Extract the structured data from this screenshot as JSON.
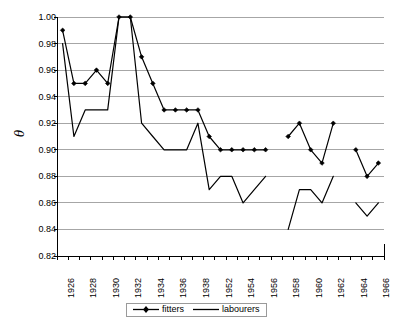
{
  "chart_data": {
    "type": "line",
    "title": "",
    "xlabel": "",
    "ylabel": "θ",
    "ylim": [
      0.82,
      1.0
    ],
    "ytick_step": 0.02,
    "yticks": [
      "1.00",
      "0.98",
      "0.96",
      "0.94",
      "0.92",
      "0.90",
      "0.88",
      "0.86",
      "0.84",
      "0.82"
    ],
    "grid": "horizontal",
    "legend_position": "bottom",
    "categories": [
      1926,
      1927,
      1928,
      1929,
      1930,
      1931,
      1932,
      1933,
      1934,
      1935,
      1936,
      1937,
      1938,
      1951,
      1952,
      1953,
      1954,
      1955,
      1956,
      1957,
      1958,
      1959,
      1960,
      1961,
      1962,
      1963,
      1964,
      1965,
      1966
    ],
    "xtick_labels": [
      "1926",
      "1928",
      "1930",
      "1932",
      "1934",
      "1936",
      "1938",
      "1952",
      "1954",
      "1956",
      "1958",
      "1960",
      "1962",
      "1964",
      "1966"
    ],
    "xtick_label_categories": [
      1926,
      1928,
      1930,
      1932,
      1934,
      1936,
      1938,
      1952,
      1954,
      1956,
      1958,
      1960,
      1962,
      1964,
      1966
    ],
    "series": [
      {
        "name": "fitters",
        "marker": "diamond",
        "color": "#000000",
        "values": [
          0.99,
          0.95,
          0.95,
          0.96,
          0.95,
          1.0,
          1.0,
          0.97,
          0.95,
          0.93,
          0.93,
          0.93,
          0.93,
          0.91,
          0.9,
          0.9,
          0.9,
          0.9,
          0.9,
          null,
          0.91,
          0.92,
          0.9,
          0.89,
          0.92,
          null,
          0.9,
          0.88,
          0.89
        ]
      },
      {
        "name": "labourers",
        "marker": "none",
        "color": "#000000",
        "values": [
          0.98,
          0.91,
          0.93,
          0.93,
          0.93,
          1.0,
          1.0,
          0.92,
          0.91,
          0.9,
          0.9,
          0.9,
          0.92,
          0.87,
          0.88,
          0.88,
          0.86,
          0.87,
          0.88,
          null,
          0.84,
          0.87,
          0.87,
          0.86,
          0.88,
          null,
          0.86,
          0.85,
          0.86
        ]
      }
    ]
  },
  "legend": {
    "items": [
      {
        "label": "fitters"
      },
      {
        "label": "labourers"
      }
    ]
  },
  "colors": {
    "gridline": "#a6a6a6",
    "axis": "#000000",
    "series": "#000000",
    "background": "#ffffff"
  }
}
